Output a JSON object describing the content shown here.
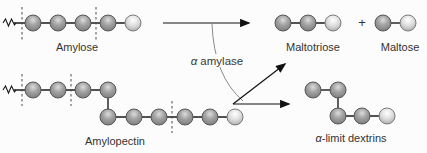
{
  "figure": {
    "background": "#fcfcfc",
    "text_color": "#333333",
    "labels": {
      "amylose": "Amylose",
      "amylopectin": "Amylopectin",
      "maltotriose": "Maltotriose",
      "maltose": "Maltose",
      "plus": "+",
      "enzyme_alpha": "α",
      "enzyme_name": "amylase",
      "dextrins_alpha": "α",
      "dextrins_rest": "-limit dextrins"
    },
    "molecules": [
      {
        "name": "Amylose",
        "glucose_units_shown": 5,
        "form": "linear chain with continuation squiggle",
        "dashed_cleavage_sites": 2
      },
      {
        "name": "Amylopectin",
        "glucose_units_shown": 10,
        "form": "branched chain with continuation squiggle",
        "dashed_cleavage_sites": 3
      },
      {
        "name": "Maltotriose",
        "glucose_units_shown": 3,
        "form": "linear chain"
      },
      {
        "name": "Maltose",
        "glucose_units_shown": 2,
        "form": "linear chain"
      },
      {
        "name": "α-limit dextrins",
        "glucose_units_shown": 5,
        "form": "branched chain"
      }
    ],
    "sphere_colors": {
      "regular_highlight": "#dcdcdc",
      "regular_body": "#a2a2a2",
      "regular_edge": "#7a7a7a",
      "terminal_highlight": "#ffffff",
      "terminal_body": "#dedede",
      "terminal_edge": "#a8a8a8"
    }
  }
}
